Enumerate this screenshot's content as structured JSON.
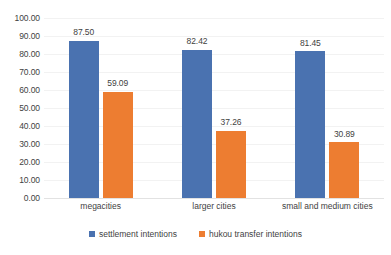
{
  "chart_data": {
    "type": "bar",
    "title": "",
    "xlabel": "",
    "ylabel": "",
    "categories": [
      "megacities",
      "larger cities",
      "small and medium cities"
    ],
    "series": [
      {
        "name": "settlement intentions",
        "color": "#4a72b0",
        "values": [
          87.5,
          82.42,
          81.45
        ],
        "labels": [
          "87.50",
          "82.42",
          "81.45"
        ]
      },
      {
        "name": "hukou transfer intentions",
        "color": "#ed7d31",
        "values": [
          59.09,
          37.26,
          30.89
        ],
        "labels": [
          "59.09",
          "37.26",
          "30.89"
        ]
      }
    ],
    "ylim": [
      0,
      100
    ],
    "yticks": [
      0,
      10,
      20,
      30,
      40,
      50,
      60,
      70,
      80,
      90,
      100
    ],
    "ytick_labels": [
      "0.00",
      "10.00",
      "20.00",
      "30.00",
      "40.00",
      "50.00",
      "60.00",
      "70.00",
      "80.00",
      "90.00",
      "100.00"
    ],
    "grid": true,
    "legend_position": "bottom"
  }
}
